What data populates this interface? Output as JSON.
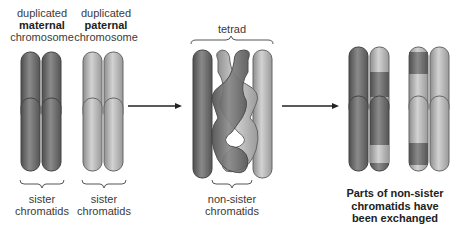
{
  "labels": {
    "maternal": {
      "line1": "duplicated",
      "line2": "maternal",
      "line3": "chromosome"
    },
    "paternal": {
      "line1": "duplicated",
      "line2": "paternal",
      "line3": "chromosome"
    },
    "tetrad": "tetrad",
    "sister1": {
      "line1": "sister",
      "line2": "chromatids"
    },
    "sister2": {
      "line1": "sister",
      "line2": "chromatids"
    },
    "nonsister": {
      "line1": "non-sister",
      "line2": "chromatids"
    },
    "result": {
      "line1": "Parts of non-sister",
      "line2": "chromatids have",
      "line3": "been exchanged"
    }
  },
  "colors": {
    "maternal": "#6e6e6e",
    "paternal": "#b4b4b4",
    "arrow": "#222222",
    "text": "#3a3a3a"
  },
  "stages": [
    "duplicated homologs",
    "tetrad with crossing over",
    "recombined chromatids"
  ]
}
